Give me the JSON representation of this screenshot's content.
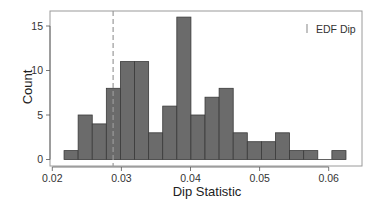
{
  "chart_data": {
    "type": "bar",
    "subtype": "histogram",
    "title": "",
    "xlabel": "Dip Statistic",
    "ylabel": "Count",
    "xlim": [
      0.02,
      0.0635
    ],
    "ylim": [
      0,
      16.5
    ],
    "x_ticks": [
      0.02,
      0.03,
      0.04,
      0.05,
      0.06
    ],
    "x_tick_labels": [
      "0.02",
      "0.03",
      "0.04",
      "0.05",
      "0.06"
    ],
    "y_ticks": [
      0,
      5,
      10,
      15
    ],
    "y_tick_labels": [
      "0",
      "5",
      "10",
      "15"
    ],
    "grid": false,
    "bin_start": 0.0217,
    "bin_width": 0.00204,
    "bin_edges": [
      0.0217,
      0.0237,
      0.0258,
      0.0278,
      0.0299,
      0.0319,
      0.034,
      0.036,
      0.038,
      0.0401,
      0.0421,
      0.0442,
      0.0462,
      0.0482,
      0.0503,
      0.0523,
      0.0544,
      0.0564,
      0.0584,
      0.0605,
      0.0625
    ],
    "values": [
      1,
      5,
      4,
      8,
      11,
      11,
      3,
      6,
      16,
      5,
      7,
      8,
      3,
      2,
      2,
      3,
      1,
      1,
      0,
      1
    ],
    "reference_line": {
      "label": "EDF Dip",
      "x": 0.0288,
      "style": "dashed",
      "color": "#9a9a9a"
    },
    "legend": {
      "position": "top-right",
      "entries": [
        {
          "label": "EDF Dip",
          "symbol": "|"
        }
      ]
    },
    "colors": {
      "bar_fill": "#6b6b6b",
      "bar_edge": "#3a3a3a",
      "frame": "#9a9a9a",
      "axis": "#555555"
    }
  }
}
